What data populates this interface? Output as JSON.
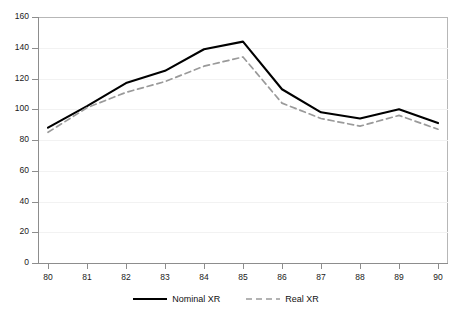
{
  "chart_data": {
    "type": "line",
    "title": "",
    "subtitle": "",
    "xlabel": "",
    "ylabel": "",
    "x": [
      "80",
      "81",
      "82",
      "83",
      "84",
      "85",
      "86",
      "87",
      "88",
      "89",
      "90"
    ],
    "categories": [
      "80",
      "81",
      "82",
      "83",
      "84",
      "85",
      "86",
      "87",
      "88",
      "89",
      "90"
    ],
    "series": [
      {
        "name": "Nominal XR",
        "values": [
          88,
          102,
          117,
          125,
          139,
          144,
          113,
          98,
          94,
          100,
          91
        ],
        "color": "#000000",
        "style": "solid",
        "width": 2.1
      },
      {
        "name": "Real XR",
        "values": [
          85,
          101,
          111,
          118,
          128,
          134,
          104,
          94,
          89,
          96,
          87
        ],
        "color": "#9a9a9a",
        "style": "dashed",
        "width": 1.7
      }
    ],
    "ylim": [
      0,
      160
    ],
    "ytick_values": [
      0,
      20,
      40,
      60,
      80,
      100,
      120,
      140,
      160
    ],
    "ytick_labels": [
      "0",
      "20",
      "40",
      "60",
      "80",
      "100",
      "120",
      "140",
      "160"
    ],
    "xtick_labels": [
      "80",
      "81",
      "82",
      "83",
      "84",
      "85",
      "86",
      "87",
      "88",
      "89",
      "90"
    ],
    "grid": "horizontal-faint",
    "legend_position": "bottom-center",
    "legend_entries": [
      "Nominal XR",
      "Real XR"
    ],
    "annotations": [],
    "plot_background": "#ffffff",
    "axis_color": "#8d8d8d",
    "frame_color": "#b7b7b7"
  },
  "legend": {
    "items": [
      {
        "label": "Nominal XR",
        "swatch": "solid-black-line-swatch"
      },
      {
        "label": "Real XR",
        "swatch": "dashed-gray-line-swatch"
      }
    ]
  }
}
